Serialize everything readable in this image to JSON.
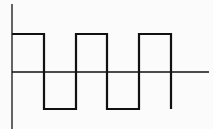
{
  "diagram": {
    "type": "square-wave",
    "background": "#fbfbfb",
    "stroke_color": "#111111",
    "axes": {
      "vertical": {
        "x": 12,
        "y1": 4,
        "y2": 129,
        "width": 1.3
      },
      "horizontal": {
        "y": 72,
        "x1": 12,
        "x2": 209,
        "width": 1.3
      }
    },
    "waveform": {
      "high_y": 34,
      "low_y": 109,
      "stroke_width": 2.2,
      "points": [
        [
          12,
          34
        ],
        [
          44,
          34
        ],
        [
          44,
          109
        ],
        [
          76,
          109
        ],
        [
          76,
          34
        ],
        [
          107,
          34
        ],
        [
          107,
          109
        ],
        [
          139,
          109
        ],
        [
          139,
          34
        ],
        [
          171,
          34
        ],
        [
          171,
          109
        ]
      ],
      "cycles": 2.5
    }
  }
}
